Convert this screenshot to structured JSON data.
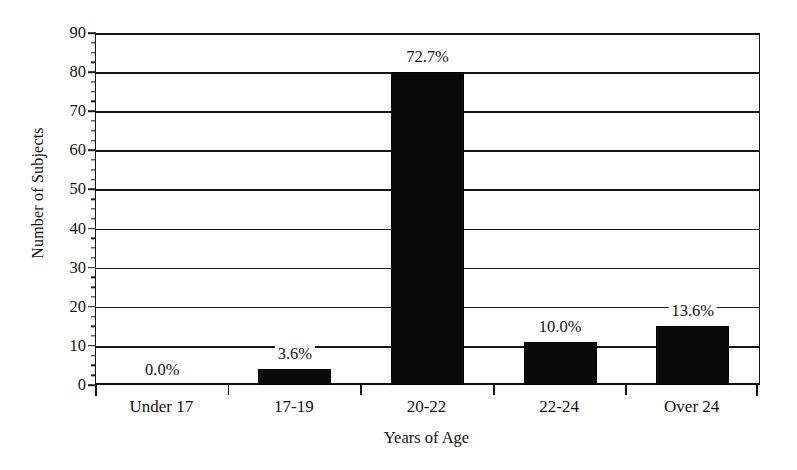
{
  "chart_data": {
    "type": "bar",
    "title": "",
    "subtitle": "",
    "xlabel": "Years of Age",
    "ylabel": "Number of Subjects",
    "categories": [
      "Under 17",
      "17-19",
      "20-22",
      "22-24",
      "Over 24"
    ],
    "values": [
      0,
      4,
      80,
      11,
      15
    ],
    "data_labels": [
      "0.0%",
      "3.6%",
      "72.7%",
      "10.0%",
      "13.6%"
    ],
    "ylim": [
      0,
      90
    ],
    "ytick_step": 10,
    "yticks": [
      0,
      10,
      20,
      30,
      40,
      50,
      60,
      70,
      80,
      90
    ],
    "ytick_labels": [
      "0",
      "10",
      "20",
      "30",
      "40",
      "50",
      "60",
      "70",
      "80",
      "90"
    ],
    "minor_tick_step": 2.5,
    "grid": "horizontal",
    "legend": "none",
    "bar_color": "#0a0a0a",
    "axis_color": "#131313",
    "background_color": "#ffffff",
    "series": [
      {
        "name": "Number of Subjects",
        "values": [
          0,
          4,
          80,
          11,
          15
        ]
      }
    ]
  }
}
